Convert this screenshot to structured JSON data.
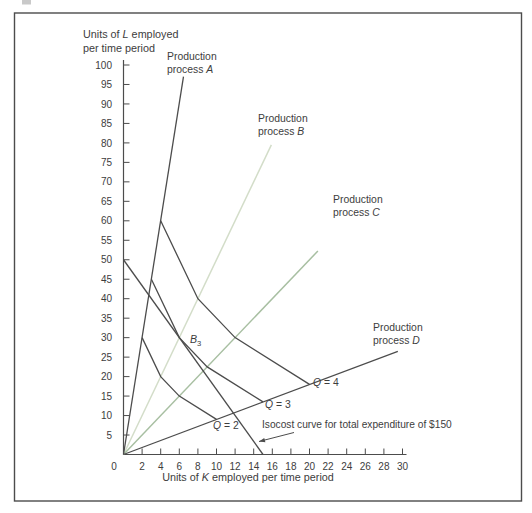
{
  "figure": {
    "kind": "textbook-production-isoquant-figure",
    "frame_color": "#4c4c4c",
    "background": "#ffffff"
  },
  "chart_data": {
    "type": "line",
    "title": "",
    "xlabel": "Units of K employed per time period",
    "ylabel": "Units of L employed per time period",
    "xlim": [
      0,
      30
    ],
    "ylim": [
      0,
      100
    ],
    "x_ticks": [
      0,
      2,
      4,
      6,
      8,
      10,
      12,
      14,
      16,
      18,
      20,
      22,
      24,
      26,
      28,
      30
    ],
    "y_ticks": [
      5,
      10,
      15,
      20,
      25,
      30,
      35,
      40,
      45,
      50,
      55,
      60,
      65,
      70,
      75,
      80,
      85,
      90,
      95,
      100
    ],
    "grid": false,
    "colors": {
      "dark": "#4c4c4c",
      "ray_b": "#d3ddc9",
      "ray_c": "#a8bfa2",
      "text": "#3d3d3d"
    },
    "axis_titles": {
      "y_title_lines": [
        [
          "Units of ",
          {
            "t": "L",
            "i": true
          },
          " employed"
        ],
        [
          "per time period"
        ]
      ],
      "x_title": [
        "Units of ",
        {
          "t": "K",
          "i": true
        },
        " employed per time period"
      ]
    },
    "processes": [
      {
        "name": "A",
        "units_per_output_K": 1,
        "units_per_output_L": 15,
        "slope_L_per_K": 15,
        "draw_to": [
          6.45,
          97
        ],
        "color": "dark",
        "label_lines": [
          [
            "Production"
          ],
          [
            "process ",
            {
              "t": "A",
              "i": true
            }
          ]
        ],
        "label_px": [
          167,
          60
        ]
      },
      {
        "name": "B",
        "units_per_output_K": 2,
        "units_per_output_L": 10,
        "slope_L_per_K": 5,
        "draw_to": [
          15.9,
          79.5
        ],
        "color": "ray_b",
        "label_lines": [
          [
            "Production"
          ],
          [
            "process ",
            {
              "t": "B",
              "i": true
            }
          ]
        ],
        "label_px": [
          258,
          122
        ]
      },
      {
        "name": "C",
        "units_per_output_K": 3,
        "units_per_output_L": 7.5,
        "slope_L_per_K": 2.5,
        "draw_to": [
          20.9,
          52.25
        ],
        "color": "ray_c",
        "label_lines": [
          [
            "Production"
          ],
          [
            "process ",
            {
              "t": "C",
              "i": true
            }
          ]
        ],
        "label_px": [
          333,
          203
        ]
      },
      {
        "name": "D",
        "units_per_output_K": 5,
        "units_per_output_L": 4.5,
        "slope_L_per_K": 0.9,
        "draw_to": [
          29.5,
          26.5
        ],
        "color": "dark",
        "label_lines": [
          [
            "Production"
          ],
          [
            "process ",
            {
              "t": "D",
              "i": true
            }
          ]
        ],
        "label_px": [
          373,
          331
        ]
      }
    ],
    "isoquants": [
      {
        "q": 2,
        "label_parts": [
          {
            "t": "Q",
            "i": true
          },
          " = 2"
        ],
        "label_px": [
          213,
          429
        ],
        "points": [
          [
            2,
            30
          ],
          [
            4,
            20
          ],
          [
            6,
            15
          ],
          [
            10,
            9
          ]
        ]
      },
      {
        "q": 3,
        "label_parts": [
          {
            "t": "Q",
            "i": true
          },
          " = 3"
        ],
        "label_px": [
          265,
          408
        ],
        "points": [
          [
            3,
            45
          ],
          [
            6,
            30
          ],
          [
            9,
            22.5
          ],
          [
            15,
            13.5
          ]
        ]
      },
      {
        "q": 4,
        "label_parts": [
          {
            "t": "Q",
            "i": true
          },
          " = 4"
        ],
        "label_px": [
          313,
          386
        ],
        "points": [
          [
            4,
            60
          ],
          [
            8,
            40
          ],
          [
            12,
            30
          ],
          [
            20,
            18
          ]
        ]
      }
    ],
    "isocost": {
      "total_expenditure": "$150",
      "points": [
        [
          0,
          50
        ],
        [
          15,
          0
        ]
      ],
      "label": "Isocost curve for total expenditure of $150",
      "label_px": [
        262,
        428
      ],
      "arrow_from_px": [
        294,
        432.5
      ],
      "arrow_to_px": [
        259,
        441.5
      ]
    },
    "optimum_point": {
      "name": "B3",
      "label_parts": [
        {
          "t": "B",
          "i": true
        },
        {
          "t": "3",
          "sub": true
        }
      ],
      "at": [
        6,
        30
      ],
      "label_px": [
        190,
        343
      ]
    }
  }
}
